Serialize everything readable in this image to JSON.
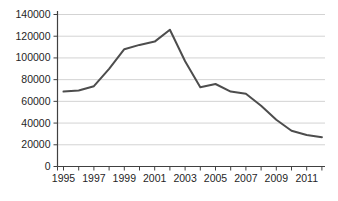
{
  "chart_data": {
    "type": "line",
    "title": "",
    "xlabel": "",
    "ylabel": "",
    "x": [
      1995,
      1996,
      1997,
      1998,
      1999,
      2000,
      2001,
      2002,
      2003,
      2004,
      2005,
      2006,
      2007,
      2008,
      2009,
      2010,
      2011,
      2012
    ],
    "values": [
      69000,
      70000,
      74000,
      90000,
      108000,
      112000,
      115000,
      126000,
      97000,
      73000,
      76000,
      69000,
      67000,
      56000,
      43000,
      33000,
      29000,
      27000
    ],
    "ylim": [
      0,
      140000
    ],
    "ytick_interval": 20000,
    "ytick_labels": [
      "0",
      "20000",
      "40000",
      "60000",
      "80000",
      "100000",
      "120000",
      "140000"
    ],
    "xtick_labels": [
      "1995",
      "1997",
      "1999",
      "2001",
      "2003",
      "2005",
      "2007",
      "2009",
      "2011"
    ],
    "grid": true,
    "legend_position": "none",
    "colors": {
      "line": "#4d4d4d",
      "grid": "#d3d3d3",
      "axis": "#404040",
      "tick": "#404040",
      "text": "#1f1f1f",
      "background": "#ffffff"
    }
  }
}
